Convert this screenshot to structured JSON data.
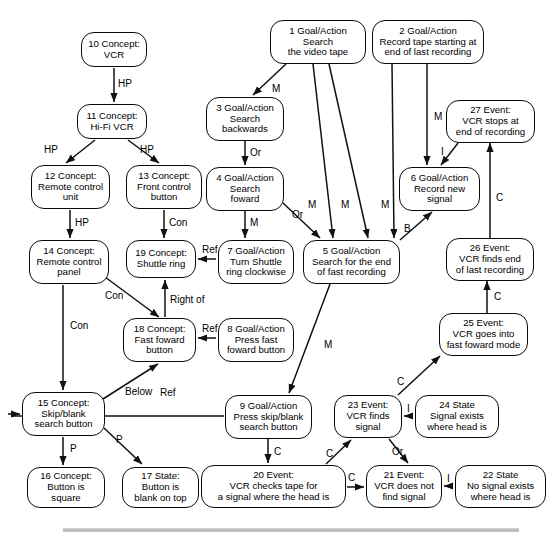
{
  "diagram": {
    "size": {
      "width": 559,
      "height": 541
    },
    "style": {
      "node_stroke": "#0a0a0a",
      "node_fill": "#ffffff",
      "edge_stroke": "#111111",
      "text_color": "#000000",
      "rule_color": "#b4b4b4"
    },
    "nodes": [
      {
        "id": "n1",
        "num": "1",
        "kind": "Goal/Action",
        "label": "1 Goal/Action\nSearch\nthe video tape",
        "x": 270,
        "y": 20,
        "w": 96,
        "h": 44,
        "fs": 9.6
      },
      {
        "id": "n2",
        "num": "2",
        "kind": "Goal/Action",
        "label": "2 Goal/Action\nRecord tape starting at\nend of last recording",
        "x": 372,
        "y": 20,
        "w": 112,
        "h": 44,
        "fs": 9.6
      },
      {
        "id": "n3",
        "num": "3",
        "kind": "Goal/Action",
        "label": "3 Goal/Action\nSearch\nbackwards",
        "x": 206,
        "y": 97,
        "w": 78,
        "h": 44,
        "fs": 9.6
      },
      {
        "id": "n4",
        "num": "4",
        "kind": "Goal/Action",
        "label": "4 Goal/Action\nSearch\nfoward",
        "x": 206,
        "y": 167,
        "w": 78,
        "h": 44,
        "fs": 9.6
      },
      {
        "id": "n5",
        "num": "5",
        "kind": "Goal/Action",
        "label": "5 Goal/Action\nSearch for the end\nof fast recording",
        "x": 303,
        "y": 240,
        "w": 97,
        "h": 44,
        "fs": 9.6
      },
      {
        "id": "n6",
        "num": "6",
        "kind": "Goal/Action",
        "label": "6 Goal/Action\nRecord new\nsignal",
        "x": 399,
        "y": 167,
        "w": 81,
        "h": 44,
        "fs": 9.6
      },
      {
        "id": "n7",
        "num": "7",
        "kind": "Goal/Action",
        "label": "7 Goal/Action\nTurn Shuttle\nring clockwise",
        "x": 218,
        "y": 240,
        "w": 76,
        "h": 44,
        "fs": 9.6
      },
      {
        "id": "n8",
        "num": "8",
        "kind": "Goal/Action",
        "label": "8 Goal/Action\nPress fast\nfoward button",
        "x": 218,
        "y": 318,
        "w": 76,
        "h": 44,
        "fs": 9.6
      },
      {
        "id": "n9",
        "num": "9",
        "kind": "Goal/Action",
        "label": "9 Goal/Action\nPress skip/blank\nsearch button",
        "x": 225,
        "y": 395,
        "w": 87,
        "h": 44,
        "fs": 9.6
      },
      {
        "id": "n10",
        "num": "10",
        "kind": "Concept",
        "label": "10 Concept:\nVCR",
        "x": 81,
        "y": 32,
        "w": 66,
        "h": 35,
        "fs": 9.6
      },
      {
        "id": "n11",
        "num": "11",
        "kind": "Concept",
        "label": "11 Concept:\nHi-Fi VCR",
        "x": 77,
        "y": 104,
        "w": 70,
        "h": 35,
        "fs": 9.6
      },
      {
        "id": "n12",
        "num": "12",
        "kind": "Concept",
        "label": "12 Concept:\nRemote control\nunit",
        "x": 31,
        "y": 165,
        "w": 79,
        "h": 44,
        "fs": 9.6
      },
      {
        "id": "n13",
        "num": "13",
        "kind": "Concept",
        "label": "13 Concept:\nFront control\nbutton",
        "x": 126,
        "y": 165,
        "w": 76,
        "h": 44,
        "fs": 9.6
      },
      {
        "id": "n14",
        "num": "14",
        "kind": "Concept",
        "label": "14 Concept:\nRemote control\npanel",
        "x": 29,
        "y": 240,
        "w": 80,
        "h": 44,
        "fs": 9.6
      },
      {
        "id": "n15",
        "num": "15",
        "kind": "Concept",
        "label": "15 Concept:\nSkip/blank\nsearch button",
        "x": 22,
        "y": 392,
        "w": 83,
        "h": 44,
        "fs": 9.6
      },
      {
        "id": "n16",
        "num": "16",
        "kind": "Concept",
        "label": "16 Concept:\nButton is\nsquare",
        "x": 27,
        "y": 467,
        "w": 78,
        "h": 41,
        "fs": 9.6
      },
      {
        "id": "n17",
        "num": "17",
        "kind": "State",
        "label": "17 State:\nButton is\nblank on top",
        "x": 122,
        "y": 467,
        "w": 77,
        "h": 41,
        "fs": 9.6
      },
      {
        "id": "n18",
        "num": "18",
        "kind": "Concept",
        "label": "18 Concept:\nFast foward\nbutton",
        "x": 123,
        "y": 318,
        "w": 73,
        "h": 44,
        "fs": 9.6
      },
      {
        "id": "n19",
        "num": "19",
        "kind": "Concept",
        "label": "19 Concept:\nShuttle ring",
        "x": 126,
        "y": 240,
        "w": 70,
        "h": 38,
        "fs": 9.6
      },
      {
        "id": "n20",
        "num": "20",
        "kind": "Event",
        "label": "20 Event:\nVCR checks tape for\na signal where the head is",
        "x": 201,
        "y": 465,
        "w": 145,
        "h": 43,
        "fs": 9.6
      },
      {
        "id": "n21",
        "num": "21",
        "kind": "Event",
        "label": "21 Event:\nVCR does not\nfind signal",
        "x": 366,
        "y": 465,
        "w": 76,
        "h": 43,
        "fs": 9.6
      },
      {
        "id": "n22",
        "num": "22",
        "kind": "State",
        "label": "22 State\nNo signal exists\nwhere head is",
        "x": 455,
        "y": 465,
        "w": 91,
        "h": 43,
        "fs": 9.6
      },
      {
        "id": "n23",
        "num": "23",
        "kind": "Event",
        "label": "23 Event:\nVCR finds\nsignal",
        "x": 334,
        "y": 395,
        "w": 68,
        "h": 43,
        "fs": 9.6
      },
      {
        "id": "n24",
        "num": "24",
        "kind": "State",
        "label": "24 State\nSignal exists\nwhere head is",
        "x": 415,
        "y": 395,
        "w": 84,
        "h": 43,
        "fs": 9.6
      },
      {
        "id": "n25",
        "num": "25",
        "kind": "Event",
        "label": "25 Event:\nVCR goes into\nfast foward mode",
        "x": 439,
        "y": 313,
        "w": 89,
        "h": 43,
        "fs": 9.6
      },
      {
        "id": "n26",
        "num": "26",
        "kind": "Event",
        "label": "26 Event:\nVCR finds end\nof last recording",
        "x": 446,
        "y": 238,
        "w": 88,
        "h": 43,
        "fs": 9.6
      },
      {
        "id": "n27",
        "num": "27",
        "kind": "Event",
        "label": "27 Event:\nVCR stops at\nend of recording",
        "x": 446,
        "y": 100,
        "w": 89,
        "h": 43,
        "fs": 9.6
      }
    ],
    "edges": [
      {
        "id": "e1",
        "from": "n10",
        "to": "n11",
        "label": "HP",
        "path": "M 114,68 L 114,102",
        "lx": 118,
        "ly": 79
      },
      {
        "id": "e2",
        "from": "n11",
        "to": "n12",
        "label": "HP",
        "path": "M 95,140 L 66,163",
        "lx": 44,
        "ly": 145
      },
      {
        "id": "e3",
        "from": "n11",
        "to": "n13",
        "label": "HP",
        "path": "M 128,140 L 159,163",
        "lx": 140,
        "ly": 145
      },
      {
        "id": "e4",
        "from": "n12",
        "to": "n14",
        "label": "HP",
        "path": "M 70,210 L 70,238",
        "lx": 75,
        "ly": 218
      },
      {
        "id": "e5",
        "from": "n13",
        "to": "n19",
        "label": "Con",
        "path": "M 164,210 L 164,238",
        "lx": 169,
        "ly": 218
      },
      {
        "id": "e6",
        "from": "n14",
        "to": "n18",
        "label": "Con",
        "path": "M 105,277 L 159,317",
        "lx": 105,
        "ly": 291
      },
      {
        "id": "e7",
        "from": "n14",
        "to": "n15",
        "label": "Con",
        "path": "M 63,285 L 63,390",
        "lx": 70,
        "ly": 321
      },
      {
        "id": "e8",
        "from": "n18",
        "to": "n19",
        "label": "Right of",
        "path": "M 165,317 L 165,280",
        "lx": 170,
        "ly": 295
      },
      {
        "id": "e9",
        "from": "n15",
        "to": "n18",
        "label": "Below",
        "path": "M 103,399 L 158,364",
        "lx": 125,
        "ly": 387
      },
      {
        "id": "e10",
        "from": "n15",
        "to": "n16",
        "label": "P",
        "path": "M 63,437 L 63,465",
        "lx": 70,
        "ly": 444
      },
      {
        "id": "e11",
        "from": "n15",
        "to": "n17",
        "label": "P",
        "path": "M 104,428 L 142,464",
        "lx": 116,
        "ly": 435
      },
      {
        "id": "e12",
        "from": "n9",
        "to": "n15",
        "label": "Ref",
        "path": "M 224,416 L 12,416 L 12,414 L 8,414 L 8,414 L 20,414",
        "lx": 160,
        "ly": 388
      },
      {
        "id": "e13",
        "from": "n7",
        "to": "n19",
        "label": "Ref",
        "path": "M 216,259 L 198,259",
        "lx": 202,
        "ly": 245
      },
      {
        "id": "e14",
        "from": "n8",
        "to": "n18",
        "label": "Ref",
        "path": "M 216,338 L 198,338",
        "lx": 202,
        "ly": 324
      },
      {
        "id": "e15",
        "from": "n1",
        "to": "n3",
        "label": "M",
        "path": "M 286,64 L 253,95",
        "lx": 272,
        "ly": 84
      },
      {
        "id": "e16",
        "from": "n3",
        "to": "n4",
        "label": "Or",
        "path": "M 245,141 L 245,165",
        "lx": 250,
        "ly": 148
      },
      {
        "id": "e17",
        "from": "n4",
        "to": "n7",
        "label": "M",
        "path": "M 245,211 L 245,238",
        "lx": 250,
        "ly": 218
      },
      {
        "id": "e18",
        "from": "n4",
        "to": "n5",
        "label": "Or",
        "path": "M 283,203 L 320,238",
        "lx": 292,
        "ly": 210
      },
      {
        "id": "e19",
        "from": "n1",
        "to": "n5",
        "label": "M",
        "path": "M 313,64 L 333,238",
        "lx": 308,
        "ly": 200
      },
      {
        "id": "e20",
        "from": "n1",
        "to": "n5",
        "label": "M",
        "path": "M 329,64 L 368,238",
        "lx": 341,
        "ly": 200
      },
      {
        "id": "e21",
        "from": "n2",
        "to": "n5",
        "label": "M",
        "path": "M 392,64 L 394,238",
        "lx": 381,
        "ly": 200
      },
      {
        "id": "e22",
        "from": "n2",
        "to": "n6",
        "label": "M",
        "path": "M 427,64 L 427,165",
        "lx": 434,
        "ly": 112
      },
      {
        "id": "e23",
        "from": "n5",
        "to": "n6",
        "label": "B",
        "path": "M 400,240 L 432,212",
        "lx": 404,
        "ly": 224
      },
      {
        "id": "e24",
        "from": "n27",
        "to": "n6",
        "label": "I",
        "path": "M 458,143 L 441,165",
        "lx": 441,
        "ly": 147
      },
      {
        "id": "e25",
        "from": "n26",
        "to": "n27",
        "label": "C",
        "path": "M 490,238 L 490,143",
        "lx": 496,
        "ly": 193
      },
      {
        "id": "e26",
        "from": "n25",
        "to": "n26",
        "label": "C",
        "path": "M 487,313 L 487,281",
        "lx": 494,
        "ly": 292
      },
      {
        "id": "e27",
        "from": "n23",
        "to": "n25",
        "label": "C",
        "path": "M 398,395 L 440,356",
        "lx": 397,
        "ly": 377
      },
      {
        "id": "e28",
        "from": "n5",
        "to": "n9",
        "label": "M",
        "path": "M 330,284 L 289,393",
        "lx": 324,
        "ly": 340
      },
      {
        "id": "e29",
        "from": "n9",
        "to": "n20",
        "label": "C",
        "path": "M 268,439 L 268,463",
        "lx": 274,
        "ly": 447
      },
      {
        "id": "e30",
        "from": "n20",
        "to": "n23",
        "label": "C",
        "path": "M 326,464 L 351,440",
        "lx": 326,
        "ly": 449
      },
      {
        "id": "e31",
        "from": "n20",
        "to": "n21",
        "label": "C",
        "path": "M 347,487 L 364,487",
        "lx": 348,
        "ly": 473
      },
      {
        "id": "e32",
        "from": "n23",
        "to": "n21",
        "label": "Or",
        "path": "M 389,439 L 408,463",
        "lx": 392,
        "ly": 447
      },
      {
        "id": "e33",
        "from": "n24",
        "to": "n23",
        "label": "I",
        "path": "M 413,416 L 404,416",
        "lx": 407,
        "ly": 404
      },
      {
        "id": "e34",
        "from": "n22",
        "to": "n21",
        "label": "I",
        "path": "M 453,486 L 444,486",
        "lx": 447,
        "ly": 474
      }
    ],
    "bottom_rule": {
      "x": 63,
      "y": 528,
      "w": 456,
      "h": 4
    }
  }
}
